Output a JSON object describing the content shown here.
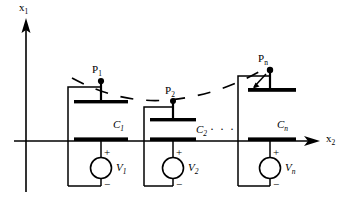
{
  "figure": {
    "type": "circuit-diagram",
    "background_color": "#ffffff",
    "ink_color": "#000000"
  },
  "axes": {
    "vertical": {
      "label": "x",
      "subscript": "1",
      "name": "x1-axis",
      "direction": "up"
    },
    "horizontal": {
      "label": "x",
      "subscript": "2",
      "name": "x2-axis",
      "direction": "right"
    }
  },
  "plates": [
    {
      "label": "P",
      "subscript": "1",
      "name": "plate-point-p1"
    },
    {
      "label": "P",
      "subscript": "2",
      "name": "plate-point-p2"
    },
    {
      "label": "P",
      "subscript": "n",
      "name": "plate-point-pn"
    }
  ],
  "capacitors": [
    {
      "label": "C",
      "subscript": "1",
      "name": "capacitor-c1"
    },
    {
      "label": "C",
      "subscript": "2",
      "name": "capacitor-c2"
    },
    {
      "label": "C",
      "subscript": "n",
      "name": "capacitor-cn"
    }
  ],
  "sources": [
    {
      "label": "V",
      "subscript": "1",
      "plus": "+",
      "minus": "−",
      "name": "voltage-source-v1"
    },
    {
      "label": "V",
      "subscript": "2",
      "plus": "+",
      "minus": "−",
      "name": "voltage-source-v2"
    },
    {
      "label": "V",
      "subscript": "n",
      "plus": "+",
      "minus": "−",
      "name": "voltage-source-vn"
    }
  ],
  "ellipsis": {
    "text": "· · ·",
    "name": "continuation-ellipsis"
  },
  "dashed_curve": {
    "name": "deflection-curve",
    "style": "dashed",
    "description": "curve through P1, P2, Pn"
  }
}
